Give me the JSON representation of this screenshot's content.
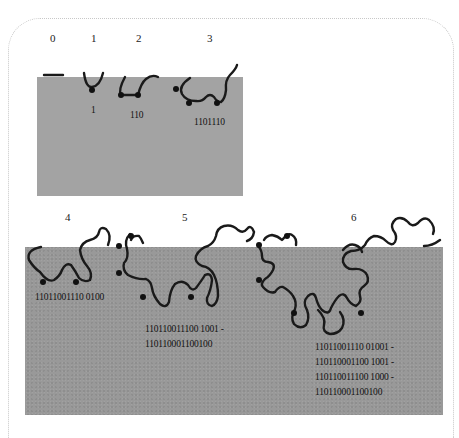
{
  "figure": {
    "stages": [
      {
        "label": "0",
        "codes": []
      },
      {
        "label": "1",
        "codes": [
          "1"
        ]
      },
      {
        "label": "2",
        "codes": [
          "110"
        ]
      },
      {
        "label": "3",
        "codes": [
          "1101110"
        ]
      },
      {
        "label": "4",
        "codes": [
          "11011001110 0100"
        ]
      },
      {
        "label": "5",
        "codes": [
          "110110011100 1001 -",
          "110110001100100"
        ]
      },
      {
        "label": "6",
        "codes": [
          "11011001110 01001 -",
          "110110001100 1001 -",
          "110110011100 1000 -",
          "110110001100100"
        ]
      }
    ],
    "code_text": {
      "s1": "1",
      "s2": "110",
      "s3": "1101110",
      "s4": "11011001110 0100",
      "s5a": "110110011100 1001 -",
      "s5b": "110110001100100",
      "s6a": "11011001110 01001 -",
      "s6b": "110110001100 1001 -",
      "s6c": "110110011100 1000 -",
      "s6d": "110110001100100"
    },
    "colors": {
      "panel": "#a3a3a3",
      "panel_bottom": "#999999",
      "curve": "#1a1a1a",
      "frame": "#c8c8c8"
    }
  }
}
